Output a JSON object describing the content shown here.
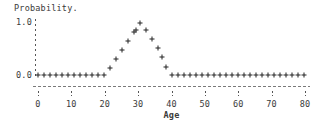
{
  "chart_data": {
    "type": "scatter",
    "title": "Probability.",
    "subtitle": "",
    "xlabel": "Age",
    "ylabel": "Probability.",
    "xlim": [
      0,
      80
    ],
    "ylim": [
      0.0,
      1.0
    ],
    "grid": false,
    "legend": null,
    "marker": "+",
    "marker_color": "#222222",
    "xticks": [
      0,
      10,
      20,
      30,
      40,
      50,
      60,
      70,
      80
    ],
    "xtick_labels": [
      "0",
      "10",
      "20",
      "30",
      "40",
      "50",
      "60",
      "70",
      "80"
    ],
    "yticks": [
      0.0,
      1.0
    ],
    "ytick_labels": [
      "0.0",
      "1.0"
    ],
    "series": [
      {
        "name": "Probability",
        "x": [
          0,
          2,
          4,
          6,
          8,
          10,
          12,
          14,
          16,
          18,
          20,
          22,
          24,
          26,
          28,
          30,
          32,
          34,
          36,
          38,
          40,
          42,
          44,
          46,
          48,
          50,
          52,
          54,
          56,
          58,
          60,
          62,
          64,
          66,
          68,
          70,
          72,
          74,
          76,
          78,
          80
        ],
        "y": [
          0.0,
          0.0,
          0.0,
          0.0,
          0.0,
          0.0,
          0.0,
          0.0,
          0.0,
          0.0,
          0.0,
          0.15,
          0.35,
          0.55,
          0.75,
          0.95,
          0.85,
          0.65,
          0.45,
          0.25,
          0.0,
          0.0,
          0.0,
          0.0,
          0.0,
          0.0,
          0.0,
          0.0,
          0.0,
          0.0,
          0.0,
          0.0,
          0.0,
          0.0,
          0.0,
          0.0,
          0.0,
          0.0,
          0.0,
          0.0,
          0.0
        ],
        "points": [
          {
            "x": 0.0,
            "y": 0.0
          },
          {
            "x": 1.8,
            "y": 0.0
          },
          {
            "x": 3.6,
            "y": 0.0
          },
          {
            "x": 5.4,
            "y": 0.0
          },
          {
            "x": 7.2,
            "y": 0.0
          },
          {
            "x": 9.0,
            "y": 0.0
          },
          {
            "x": 10.8,
            "y": 0.0
          },
          {
            "x": 12.6,
            "y": 0.0
          },
          {
            "x": 14.4,
            "y": 0.0
          },
          {
            "x": 16.2,
            "y": 0.0
          },
          {
            "x": 18.0,
            "y": 0.0
          },
          {
            "x": 19.8,
            "y": 0.0
          },
          {
            "x": 21.6,
            "y": 0.13
          },
          {
            "x": 23.4,
            "y": 0.3
          },
          {
            "x": 25.2,
            "y": 0.47
          },
          {
            "x": 27.0,
            "y": 0.64
          },
          {
            "x": 28.8,
            "y": 0.81
          },
          {
            "x": 30.6,
            "y": 0.98
          },
          {
            "x": 29.4,
            "y": 0.85
          },
          {
            "x": 32.4,
            "y": 0.85
          },
          {
            "x": 34.2,
            "y": 0.68
          },
          {
            "x": 36.0,
            "y": 0.51
          },
          {
            "x": 37.2,
            "y": 0.34
          },
          {
            "x": 38.4,
            "y": 0.15
          },
          {
            "x": 40.2,
            "y": 0.0
          },
          {
            "x": 42.0,
            "y": 0.0
          },
          {
            "x": 43.8,
            "y": 0.0
          },
          {
            "x": 45.6,
            "y": 0.0
          },
          {
            "x": 47.4,
            "y": 0.0
          },
          {
            "x": 49.2,
            "y": 0.0
          },
          {
            "x": 51.0,
            "y": 0.0
          },
          {
            "x": 52.8,
            "y": 0.0
          },
          {
            "x": 54.6,
            "y": 0.0
          },
          {
            "x": 56.4,
            "y": 0.0
          },
          {
            "x": 58.2,
            "y": 0.0
          },
          {
            "x": 60.0,
            "y": 0.0
          },
          {
            "x": 61.8,
            "y": 0.0
          },
          {
            "x": 63.6,
            "y": 0.0
          },
          {
            "x": 65.4,
            "y": 0.0
          },
          {
            "x": 67.2,
            "y": 0.0
          },
          {
            "x": 69.0,
            "y": 0.0
          },
          {
            "x": 70.8,
            "y": 0.0
          },
          {
            "x": 72.6,
            "y": 0.0
          },
          {
            "x": 74.4,
            "y": 0.0
          },
          {
            "x": 76.2,
            "y": 0.0
          },
          {
            "x": 78.0,
            "y": 0.0
          },
          {
            "x": 79.8,
            "y": 0.0
          }
        ]
      }
    ],
    "annotations": []
  },
  "plot": {
    "title_text": "Probability.",
    "xaxis_title": "Age",
    "ytop_label": "1.0",
    "ybottom_label": "0.0"
  }
}
